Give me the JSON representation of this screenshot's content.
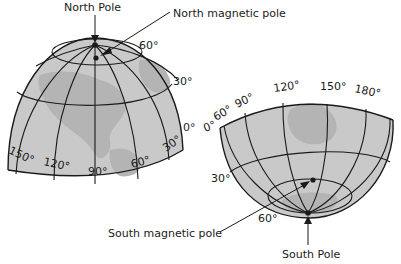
{
  "diagram": {
    "north_hemisphere": {
      "labels": {
        "north_pole": "North Pole",
        "north_magnetic_pole": "North magnetic pole"
      },
      "latitudes": [
        "60°",
        "30°",
        "0°"
      ],
      "longitudes": [
        "150°",
        "120°",
        "90°",
        "60°",
        "30°"
      ]
    },
    "south_hemisphere": {
      "labels": {
        "south_pole": "South Pole",
        "south_magnetic_pole": "South magnetic pole"
      },
      "latitudes": [
        "0°",
        "30°",
        "60°"
      ],
      "longitudes": [
        "60°",
        "90°",
        "120°",
        "150°",
        "180°"
      ]
    },
    "colors": {
      "globe_fill": "#c9c9c9",
      "land_fill": "#b4b4b4",
      "line": "#1a1a1a",
      "background": "#ffffff"
    }
  }
}
